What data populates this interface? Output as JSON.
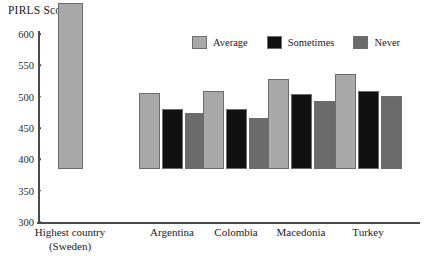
{
  "chart_data": {
    "type": "bar",
    "title": "PIRLS Scores",
    "xlabel": "",
    "ylabel": "PIRLS Scores",
    "ylim": [
      300,
      600
    ],
    "yticks": [
      600,
      550,
      500,
      450,
      400,
      350,
      300
    ],
    "grid": false,
    "legend_position": "top-center",
    "categories": [
      "Highest country (Sweden)",
      "Argentina",
      "Colombia",
      "Macedonia",
      "Turkey"
    ],
    "category_lines": [
      [
        "Highest country",
        "(Sweden)"
      ],
      [
        "Argentina",
        ""
      ],
      [
        "Colombia",
        ""
      ],
      [
        "Macedonia",
        ""
      ],
      [
        "Turkey",
        ""
      ]
    ],
    "series": [
      {
        "name": "Average",
        "color": "#a9a9a9",
        "values": [
          565,
          422,
          424,
          444,
          452
        ]
      },
      {
        "name": "Sometimes",
        "color": "#111111",
        "values": [
          null,
          395,
          396,
          420,
          425
        ]
      },
      {
        "name": "Never",
        "color": "#6b6b6b",
        "values": [
          null,
          390,
          381,
          408,
          417
        ]
      }
    ]
  },
  "legend": {
    "items": [
      {
        "label": "Average",
        "color": "#a9a9a9"
      },
      {
        "label": "Sometimes",
        "color": "#111111"
      },
      {
        "label": "Never",
        "color": "#6b6b6b"
      }
    ]
  },
  "axis": {
    "y_tick_labels": [
      "600",
      "550",
      "500",
      "450",
      "400",
      "350",
      "300"
    ]
  }
}
